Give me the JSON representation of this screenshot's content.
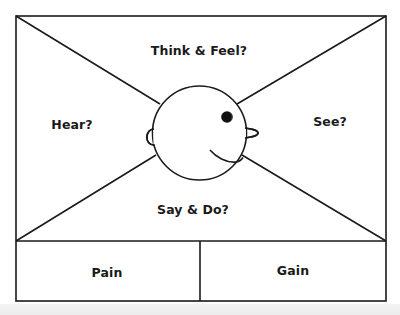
{
  "diagram": {
    "type": "empathy-map",
    "quadrants": {
      "top": "Think & Feel?",
      "left": "Hear?",
      "right": "See?",
      "bottom": "Say & Do?"
    },
    "footer": {
      "left": "Pain",
      "right": "Gain"
    },
    "center_figure": "smiling-face-profile"
  },
  "colors": {
    "stroke": "#1a1a1a",
    "background": "#ffffff",
    "text": "#1a1a1a"
  }
}
